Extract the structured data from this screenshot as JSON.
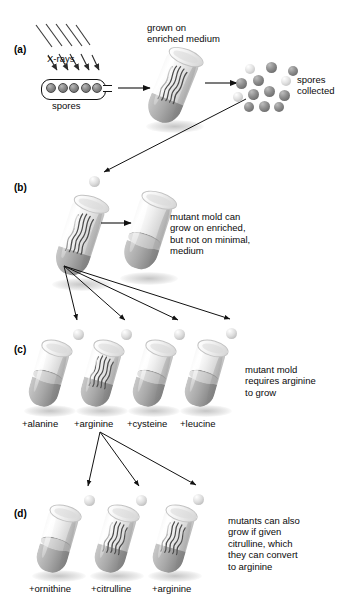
{
  "figure": {
    "ink": "#0a0a0a",
    "spore_dark": "#5a5a5a",
    "spore_light": "#dcdcdc"
  },
  "panels": [
    {
      "id": "(a)",
      "labels": {
        "xrays": "X-rays",
        "spores": "spores",
        "grown_on": "grown on\nenriched medium",
        "collected": "spores\ncollected"
      },
      "ray_count": 5,
      "capsule_spore_count": 5,
      "collected_spore_count": 13
    },
    {
      "id": "(b)",
      "caption": "mutant mold can\ngrow on enriched,\nbut not on minimal,\nmedium",
      "tubes": [
        {
          "name": "enriched",
          "growth": true
        },
        {
          "name": "minimal",
          "growth": false
        }
      ]
    },
    {
      "id": "(c)",
      "caption": "mutant mold\nrequires arginine\nto grow",
      "tubes": [
        {
          "label": "+alanine",
          "growth": false
        },
        {
          "label": "+arginine",
          "growth": true
        },
        {
          "label": "+cysteine",
          "growth": false
        },
        {
          "label": "+leucine",
          "growth": false
        }
      ]
    },
    {
      "id": "(d)",
      "caption": "mutants can also\ngrow if given\ncitrulline, which\nthey can convert\nto arginine",
      "tubes": [
        {
          "label": "+ornithine",
          "growth": false
        },
        {
          "label": "+citrulline",
          "growth": true
        },
        {
          "label": "+arginine",
          "growth": true
        }
      ]
    }
  ]
}
